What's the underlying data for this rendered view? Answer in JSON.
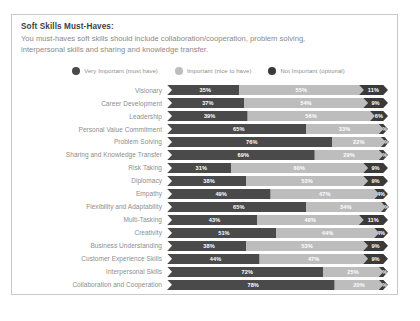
{
  "card": {
    "title": "Soft Skills Must-Haves:",
    "description": "You must-haves soft skills should include collaboration/cooperation, problem solving, interpersonal skills and sharing and knowledge transfer."
  },
  "colors": {
    "very_important": "#4a4a4a",
    "important": "#bdbdbd",
    "not_important": "#3a3a3a",
    "card_border": "#c9c9c9",
    "label_text": "#8d8d8d",
    "title_text": "#3f3f3f"
  },
  "legend": {
    "items": [
      {
        "label": "Very Important (must have)",
        "color": "#4a4a4a",
        "icon": "circle-icon"
      },
      {
        "label": "Important (nice to have)",
        "color": "#bdbdbd",
        "icon": "circle-icon"
      },
      {
        "label": "Not Important (optional)",
        "color": "#3a3a3a",
        "icon": "circle-icon"
      }
    ]
  },
  "chart_data": {
    "type": "bar",
    "subtype": "stacked-horizontal-100-percent",
    "title": "Soft Skills Must-Haves:",
    "xlabel": "",
    "ylabel": "",
    "xlim": [
      0,
      100
    ],
    "grid": false,
    "legend_position": "top-center",
    "categories": [
      "Visionary",
      "Career Development",
      "Leadership",
      "Personal Value Commitment",
      "Problem Solving",
      "Sharing and Knowledge Transfer",
      "Risk Taking",
      "Diplomacy",
      "Empathy",
      "Flexibility and Adaptability",
      "Multi-Tasking",
      "Creativity",
      "Business Understanding",
      "Customer Experience Skills",
      "Interpersonal Skills",
      "Collaboration and Cooperation"
    ],
    "series": [
      {
        "name": "Very Important (must have)",
        "color": "#4a4a4a",
        "values": [
          35,
          37,
          39,
          65,
          76,
          69,
          31,
          38,
          49,
          65,
          43,
          51,
          38,
          44,
          72,
          78
        ]
      },
      {
        "name": "Important (nice to have)",
        "color": "#bdbdbd",
        "values": [
          55,
          54,
          56,
          33,
          22,
          29,
          60,
          53,
          47,
          34,
          46,
          44,
          53,
          47,
          25,
          20
        ]
      },
      {
        "name": "Not Important (optional)",
        "color": "#3a3a3a",
        "values": [
          11,
          9,
          6,
          2,
          1,
          2,
          9,
          9,
          4,
          1,
          11,
          4,
          9,
          9,
          2,
          2
        ]
      }
    ],
    "rows": [
      {
        "category": "Visionary",
        "very_important": "35%",
        "important": "55%",
        "not_important": "11%"
      },
      {
        "category": "Career Development",
        "very_important": "37%",
        "important": "54%",
        "not_important": "9%"
      },
      {
        "category": "Leadership",
        "very_important": "39%",
        "important": "56%",
        "not_important": "6%"
      },
      {
        "category": "Personal Value Commitment",
        "very_important": "65%",
        "important": "33%",
        "not_important": "2%"
      },
      {
        "category": "Problem Solving",
        "very_important": "76%",
        "important": "22%",
        "not_important": "1%"
      },
      {
        "category": "Sharing and Knowledge Transfer",
        "very_important": "69%",
        "important": "29%",
        "not_important": "2%"
      },
      {
        "category": "Risk Taking",
        "very_important": "31%",
        "important": "60%",
        "not_important": "9%"
      },
      {
        "category": "Diplomacy",
        "very_important": "38%",
        "important": "53%",
        "not_important": "9%"
      },
      {
        "category": "Empathy",
        "very_important": "49%",
        "important": "47%",
        "not_important": "4%"
      },
      {
        "category": "Flexibility and Adaptability",
        "very_important": "65%",
        "important": "34%",
        "not_important": "1%"
      },
      {
        "category": "Multi-Tasking",
        "very_important": "43%",
        "important": "46%",
        "not_important": "11%"
      },
      {
        "category": "Creativity",
        "very_important": "51%",
        "important": "44%",
        "not_important": "4%"
      },
      {
        "category": "Business Understanding",
        "very_important": "38%",
        "important": "53%",
        "not_important": "9%"
      },
      {
        "category": "Customer Experience Skills",
        "very_important": "44%",
        "important": "47%",
        "not_important": "9%"
      },
      {
        "category": "Interpersonal Skills",
        "very_important": "72%",
        "important": "25%",
        "not_important": "2%"
      },
      {
        "category": "Collaboration and Cooperation",
        "very_important": "78%",
        "important": "20%",
        "not_important": "2%"
      }
    ]
  }
}
